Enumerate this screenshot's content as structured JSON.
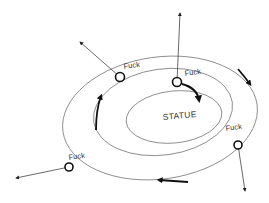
{
  "diagram": {
    "type": "concentric-orbits",
    "colors": {
      "line": "#555555",
      "bold": "#111111",
      "background": "#ffffff"
    },
    "center_label": "STATUE",
    "orbits": [
      {
        "name": "inner",
        "cx": 175,
        "cy": 117,
        "rx": 48,
        "ry": 27,
        "rotate": -6
      },
      {
        "name": "middle",
        "cx": 163,
        "cy": 112,
        "rx": 72,
        "ry": 44,
        "rotate": -8
      },
      {
        "name": "outer",
        "cx": 160,
        "cy": 118,
        "rx": 98,
        "ry": 61,
        "rotate": -8
      }
    ],
    "nodes": [
      {
        "id": "node-top-left",
        "label": "Fuck",
        "x": 120,
        "y": 77,
        "label_x": 127,
        "label_y": 67,
        "label_rotate": -8,
        "arrow_to": [
          80,
          42
        ]
      },
      {
        "id": "node-top-center",
        "label": "Fuck",
        "x": 177,
        "y": 82,
        "label_x": 185,
        "label_y": 76,
        "label_rotate": -8,
        "arrow_to": [
          180,
          12
        ]
      },
      {
        "id": "node-left",
        "label": "Fuck",
        "x": 69,
        "y": 167,
        "label_x": 67,
        "label_y": 129,
        "label_rotate": -8,
        "arrow_to": [
          15,
          178
        ],
        "label_offset_note": "label above-left of node"
      },
      {
        "id": "node-right",
        "label": "Fuck",
        "x": 238,
        "y": 145,
        "label_x": 227,
        "label_y": 131,
        "label_rotate": -8,
        "arrow_to": [
          245,
          192
        ]
      }
    ],
    "flow_arrows": [
      {
        "id": "flow-inner",
        "desc": "clockwise arrow on inner orbit near top-right"
      },
      {
        "id": "flow-middle-left",
        "desc": "upward arrow on middle orbit left side"
      },
      {
        "id": "flow-outer-right",
        "desc": "downward arrow on outer orbit upper right"
      },
      {
        "id": "flow-outer-bottom",
        "desc": "leftward arrow on outer orbit bottom"
      }
    ]
  }
}
